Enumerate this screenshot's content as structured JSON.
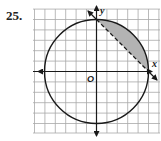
{
  "problem": {
    "number": "25."
  },
  "graph": {
    "x_axis_label": "x",
    "y_axis_label": "y",
    "origin_label": "O",
    "grid": {
      "x_range": [
        -6,
        6
      ],
      "y_range": [
        -6,
        5
      ],
      "step": 1
    },
    "circle": {
      "center": [
        0,
        0
      ],
      "radius": 5
    },
    "line": {
      "points": [
        [
          0,
          5
        ],
        [
          5,
          0
        ]
      ],
      "style": "dashed",
      "equation": "x + y = 5"
    },
    "shaded_region": {
      "description": "circular segment between chord and arc in quadrant I",
      "color": "#b3b3b3"
    },
    "colors": {
      "grid": "#a8a8a8",
      "ink": "#1a1a1a",
      "shade": "#b3b3b3"
    }
  }
}
